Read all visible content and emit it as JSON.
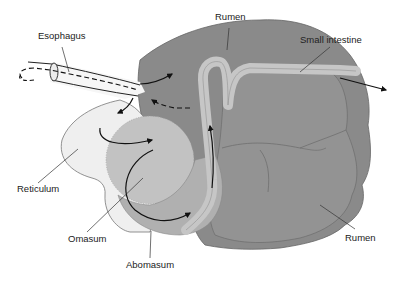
{
  "diagram": {
    "labels": {
      "esophagus": "Esophagus",
      "rumen_top": "Rumen",
      "small_intestine": "Small intestine",
      "reticulum": "Reticulum",
      "omasum": "Omasum",
      "abomasum": "Abomasum",
      "rumen_bottom": "Rumen"
    },
    "colors": {
      "rumen": "#8a8a8a",
      "rumen_lobe": "#939393",
      "reticulum": "#efefef",
      "omasum": "#c2c2c2",
      "abomasum": "#b0b0b0",
      "intestine": "#c6c6c6",
      "outline": "#555555",
      "arrow": "#111111",
      "leader": "#333333"
    }
  }
}
